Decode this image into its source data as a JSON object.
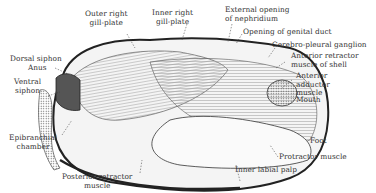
{
  "figure": {
    "labels": {
      "outer_right_gill_plate": "Outer right\ngill-plate",
      "inner_right_gill_plate": "Inner right\ngill-plate",
      "external_opening_nephridium": "External opening\nof nephridium",
      "opening_genital_duct": "Opening of genital duct",
      "cerebro_pleural_ganglion": "Cerebro-pleural ganglion",
      "anterior_retractor": "Anterior retractor\nmuscle of shell",
      "anterior_adductor": "Anterior\nadductor\nmuscle",
      "mouth": "Mouth",
      "dorsal_siphon": "Dorsal siphon",
      "anus": "Anus",
      "ventral_siphon": "Ventral\nsiphon",
      "epibranchial_chamber": "Epibranchial\nchamber",
      "posterior_retractor": "Posterior retractor\nmuscle",
      "foot": "Foot",
      "protractor_muscle": "Protractor muscle",
      "inner_labial_palp": "Inner labial palp"
    }
  },
  "colors": {
    "ink": "#222222",
    "background": "#ffffff",
    "shade": "#888888"
  }
}
